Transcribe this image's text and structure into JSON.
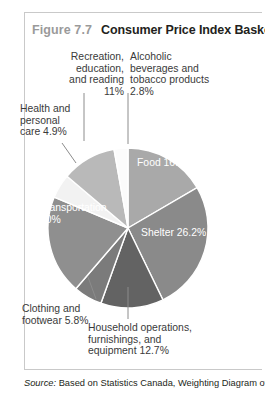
{
  "figure": {
    "number": "Figure 7.7",
    "title": "Consumer Price Index Basket"
  },
  "source": {
    "label": "Source:",
    "text": " Based on Statistics Canada, Weighting Diagram of"
  },
  "callouts": {
    "recreation": "Recreation,\neducation,\nand reading\n11%",
    "alcohol": "Alcoholic\nbeverages and\ntobacco products\n2.8%",
    "health": "Health and\npersonal\ncare 4.9%",
    "clothing": "Clothing and\nfootwear 5.8%",
    "household": "Household operations,\nfurnishings, and\nequipment 12.7%"
  },
  "wedge_labels": {
    "food": "Food 16.6%",
    "shelter": "Shelter 26.2%",
    "transportation": "Transportation\n20%"
  },
  "chart_data": {
    "type": "pie",
    "title": "Consumer Price Index Basket",
    "subtitle": "",
    "xlabel": "",
    "ylabel": "",
    "units": "percent",
    "legend_position": "none",
    "grid": false,
    "label_style": "callout-lines-and-inner-labels",
    "start_angle_deg": 0,
    "direction": "clockwise",
    "total": 100.0,
    "categories": [
      "Food",
      "Shelter",
      "Household operations, furnishings, and equipment",
      "Clothing and footwear",
      "Transportation",
      "Health and personal care",
      "Recreation, education, and reading",
      "Alcoholic beverages and tobacco products"
    ],
    "values": [
      16.6,
      26.2,
      12.7,
      5.8,
      20.0,
      4.9,
      11.0,
      2.8
    ],
    "value_labels": [
      "16.6%",
      "26.2%",
      "12.7%",
      "5.8%",
      "20%",
      "4.9%",
      "11%",
      "2.8%"
    ],
    "colors": [
      "#a9a9a9",
      "#8a8a8a",
      "#636363",
      "#7b7b7b",
      "#8f8f8f",
      "#f2f2f2",
      "#b9b9b9",
      "#fbfbfb"
    ],
    "slice_separator_color": "#ffffff"
  },
  "geometry": {
    "cx": 128,
    "cy": 191,
    "r": 80
  }
}
